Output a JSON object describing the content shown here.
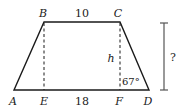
{
  "diagram": {
    "type": "trapezoid",
    "vertices": {
      "A": "A",
      "B": "B",
      "C": "C",
      "D": "D"
    },
    "feet": {
      "E": "E",
      "F": "F"
    },
    "top_length": "10",
    "middle_base_length": "18",
    "height_label": "h",
    "angle_label": "67°",
    "unknown_label": "?",
    "colors": {
      "stroke": "#1a1a1a",
      "dimension_bar": "#555555",
      "background": "#ffffff"
    }
  }
}
